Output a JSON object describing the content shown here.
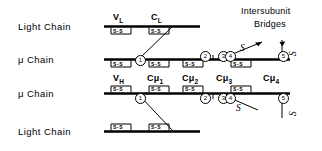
{
  "figure": {
    "type": "diagram",
    "background": "#ffffff",
    "ink": "#000000"
  },
  "chain_labels": [
    {
      "id": "row1",
      "text": "Light Chain"
    },
    {
      "id": "row2",
      "text": "μ  Chain"
    },
    {
      "id": "row3",
      "text": "μ  Chain"
    },
    {
      "id": "row4",
      "text": "Light Chain"
    }
  ],
  "domain_labels": {
    "light_top": [
      {
        "text": "V",
        "sub": "L"
      },
      {
        "text": "C",
        "sub": "L"
      }
    ],
    "mu_lower": [
      {
        "text": "V",
        "sub": "H"
      },
      {
        "text": "Cμ",
        "sub": "1"
      },
      {
        "text": "Cμ",
        "sub": "2"
      },
      {
        "text": "Cμ",
        "sub": "3"
      },
      {
        "text": "Cμ",
        "sub": "4"
      }
    ]
  },
  "ss_label": "S-S",
  "ss_brackets": {
    "row1_light_top": 2,
    "row2_mu_upper": 4,
    "row3_mu_lower": 4,
    "row4_light_bottom": 2
  },
  "circled_numbers": {
    "mu_upper": [
      "1",
      "2",
      "3",
      "4",
      "5"
    ],
    "mu_lower": [
      "1",
      "2",
      "3",
      "4",
      "5"
    ]
  },
  "annotation": {
    "line1": "Intersubunit",
    "line2": "Bridges"
  },
  "sulfur_labels": [
    {
      "id": "s-upper-diagonal",
      "text": "S"
    },
    {
      "id": "s-upper-vertical",
      "text": "S"
    },
    {
      "id": "s-lower-diagonal",
      "text": "S"
    },
    {
      "id": "s-lower-vertical",
      "text": "S"
    }
  ]
}
